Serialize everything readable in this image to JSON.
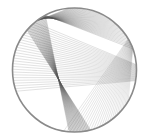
{
  "figure": {
    "circle": {
      "cx": 74.5,
      "cy": 70,
      "r": 62,
      "stroke": "#8a8a8a",
      "stroke_width": 1.6
    },
    "line_color": "#555555",
    "families": [
      {
        "name": "left-fan",
        "count": 28,
        "from_deg": [
          200,
          130
        ],
        "to_deg": [
          -10,
          5
        ],
        "opacity": 0.35
      },
      {
        "name": "top-sweep",
        "count": 40,
        "from_deg": [
          118,
          128
        ],
        "to_deg": [
          20,
          95
        ],
        "opacity": 0.4
      },
      {
        "name": "center-curve",
        "count": 30,
        "from_deg": [
          118,
          140
        ],
        "to_deg": [
          -95,
          -75
        ],
        "opacity": 0.45
      },
      {
        "name": "bottom-right-fan",
        "count": 26,
        "from_deg": [
          -100,
          -30
        ],
        "to_deg": [
          30,
          20
        ],
        "opacity": 0.3
      }
    ]
  }
}
